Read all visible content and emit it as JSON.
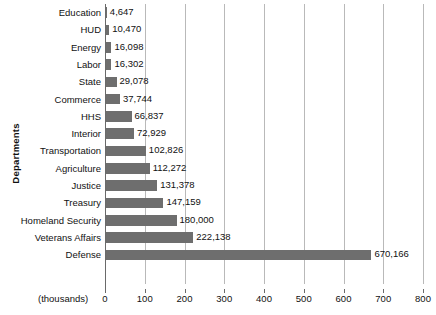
{
  "chart_data": {
    "type": "bar",
    "orientation": "horizontal",
    "title": "",
    "xlabel": "(thousands)",
    "ylabel": "Departments",
    "xlim": [
      0,
      800
    ],
    "grid": true,
    "legend": "none",
    "xticks": [
      0,
      100,
      200,
      300,
      400,
      500,
      600,
      700,
      800
    ],
    "xtick_labels": [
      "0",
      "100",
      "200",
      "300",
      "400",
      "500",
      "600",
      "700",
      "800"
    ],
    "units_note": "(thousands)",
    "bar_color": "#6e6e6e",
    "gridline_color": "#b9b9b9",
    "categories": [
      "Education",
      "HUD",
      "Energy",
      "Labor",
      "State",
      "Commerce",
      "HHS",
      "Interior",
      "Transportation",
      "Agriculture",
      "Justice",
      "Treasury",
      "Homeland Security",
      "Veterans Affairs",
      "Defense"
    ],
    "values": [
      4647,
      10470,
      16098,
      16302,
      29078,
      37744,
      66837,
      72929,
      102826,
      112272,
      131378,
      147159,
      180000,
      222138,
      670166
    ],
    "value_labels": [
      "4,647",
      "10,470",
      "16,098",
      "16,302",
      "29,078",
      "37,744",
      "66,837",
      "72,929",
      "102,826",
      "112,272",
      "131,378",
      "147,159",
      "180,000",
      "222,138",
      "670,166"
    ]
  }
}
